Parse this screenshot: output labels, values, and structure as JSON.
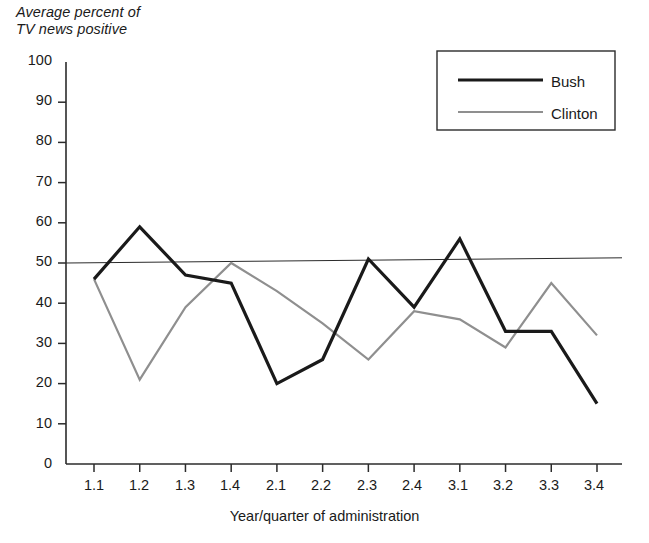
{
  "chart_data": {
    "type": "line",
    "title": "",
    "ylabel": "Average percent of\nTV news positive",
    "xlabel": "Year/quarter of administration",
    "categories": [
      "1.1",
      "1.2",
      "1.3",
      "1.4",
      "2.1",
      "2.2",
      "2.3",
      "2.4",
      "3.1",
      "3.2",
      "3.3",
      "3.4"
    ],
    "ylim": [
      0,
      100
    ],
    "yticks": [
      "0",
      "10",
      "20",
      "30",
      "40",
      "50",
      "60",
      "70",
      "80",
      "90",
      "100"
    ],
    "grid": false,
    "legend_position": "top-right",
    "series": [
      {
        "name": "Bush",
        "color": "#1a1a1a",
        "width": 3.2,
        "values": [
          46,
          59,
          47,
          45,
          20,
          26,
          51,
          39,
          56,
          33,
          33,
          15
        ]
      },
      {
        "name": "Clinton",
        "color": "#8f8f8f",
        "width": 2.2,
        "values": [
          46,
          21,
          39,
          50,
          43,
          35,
          26,
          38,
          36,
          29,
          45,
          32
        ]
      }
    ],
    "reference_line": {
      "name": "trend-line",
      "color": "#2b2b2b",
      "width": 1,
      "start_value": 50,
      "end_value": 51.3
    }
  },
  "legend": {
    "items": [
      {
        "label": "Bush",
        "swatch": "bush-line-swatch"
      },
      {
        "label": "Clinton",
        "swatch": "clinton-line-swatch"
      }
    ]
  },
  "axis": {
    "y_label_text": "Average percent of\nTV news positive",
    "x_label_text": "Year/quarter of administration"
  }
}
